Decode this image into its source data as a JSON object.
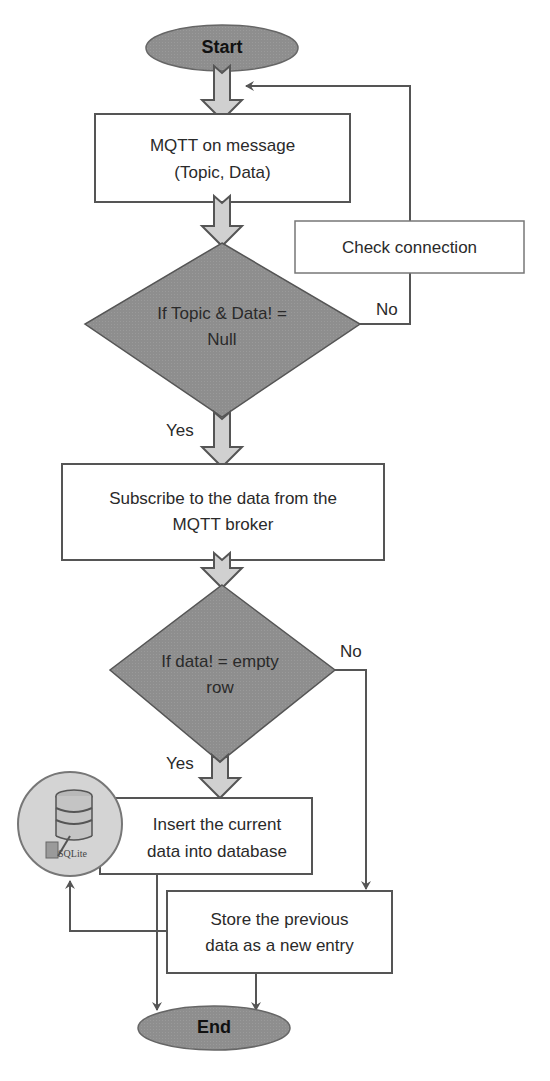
{
  "diagram": {
    "type": "flowchart",
    "colors": {
      "terminal_fill": "#8e8e8e",
      "decision_fill": "#8c8c8c",
      "process_fill": "#ffffff",
      "stroke": "#555555",
      "block_arrow_fill": "#cfcfcf"
    },
    "nodes": {
      "start": {
        "shape": "ellipse",
        "label": "Start"
      },
      "mqtt_on_message": {
        "shape": "rect",
        "line1": "MQTT on message",
        "line2": "(Topic, Data)"
      },
      "check_connection": {
        "shape": "rect",
        "label": "Check connection"
      },
      "decision_topic_data": {
        "shape": "diamond",
        "line1": "If Topic & Data! =",
        "line2": "Null"
      },
      "subscribe": {
        "shape": "rect",
        "line1": "Subscribe to the data from the",
        "line2": "MQTT broker"
      },
      "decision_empty_row": {
        "shape": "diamond",
        "line1": "If data! = empty",
        "line2": "row"
      },
      "insert_current": {
        "shape": "rect",
        "line1": "Insert the current",
        "line2": "data into database"
      },
      "sqlite_icon": {
        "shape": "circle-icon",
        "label": "SQLite"
      },
      "store_previous": {
        "shape": "rect",
        "line1": "Store the previous",
        "line2": "data as a new entry"
      },
      "end": {
        "shape": "ellipse",
        "label": "End"
      }
    },
    "edges": {
      "decision1_no": "No",
      "decision1_yes": "Yes",
      "decision2_no": "No",
      "decision2_yes": "Yes"
    }
  }
}
